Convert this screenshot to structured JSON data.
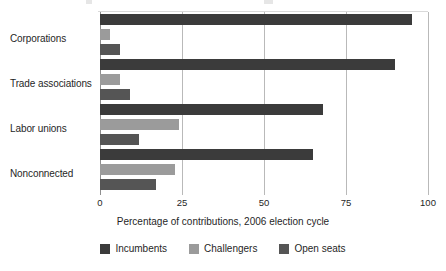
{
  "chart_data": {
    "type": "bar",
    "orientation": "horizontal",
    "title": "",
    "xlabel": "Percentage of contributions, 2006 election cycle",
    "ylabel": "",
    "categories": [
      "Corporations",
      "Trade associations",
      "Labor unions",
      "Nonconnected"
    ],
    "series": [
      {
        "name": "Incumbents",
        "color": "#3b3b3b",
        "values": [
          95,
          90,
          68,
          65
        ]
      },
      {
        "name": "Challengers",
        "color": "#9b9b9b",
        "values": [
          3,
          6,
          24,
          23
        ]
      },
      {
        "name": "Open seats",
        "color": "#555555",
        "values": [
          6,
          9,
          12,
          17
        ]
      }
    ],
    "xlim": [
      0,
      100
    ],
    "xticks": [
      0,
      25,
      50,
      75,
      100
    ],
    "xtick_labels": [
      "0",
      "25",
      "50",
      "75",
      "100"
    ],
    "grid": "vertical",
    "legend_position": "bottom"
  },
  "axis": {
    "x_title": "Percentage of contributions, 2006 election cycle",
    "ticks": [
      {
        "label": "0",
        "value": 0
      },
      {
        "label": "25",
        "value": 25
      },
      {
        "label": "50",
        "value": 50
      },
      {
        "label": "75",
        "value": 75
      },
      {
        "label": "100",
        "value": 100
      }
    ]
  },
  "categories": [
    {
      "label": "Corporations"
    },
    {
      "label": "Trade associations"
    },
    {
      "label": "Labor unions"
    },
    {
      "label": "Nonconnected"
    }
  ],
  "legend": {
    "items": [
      {
        "label": "Incumbents",
        "color": "#3b3b3b"
      },
      {
        "label": "Challengers",
        "color": "#9b9b9b"
      },
      {
        "label": "Open seats",
        "color": "#555555"
      }
    ]
  }
}
